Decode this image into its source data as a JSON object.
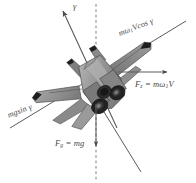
{
  "figure": {
    "background_color": "#ffffff",
    "line_color": "#58585a",
    "text_color": "#4a4a4a",
    "aircraft": {
      "name": "fighter-jet",
      "view": "rear-three-quarter",
      "body_fill": "#8d8d8d",
      "body_fill_dark": "#6b6b6b",
      "body_fill_light": "#b3b3b3",
      "wing_fill": "#a3a3a3",
      "edge_fill": "#1b1b1b",
      "nozzle_fill": "#2a2a2a"
    },
    "axes": [
      {
        "name": "vertical-dashed-reference",
        "style": "dashed",
        "orientation": "vertical",
        "arrow": "none"
      },
      {
        "name": "inclined-flight-path-axis",
        "style": "solid",
        "orientation": "inclined",
        "arrow": "start"
      },
      {
        "name": "lift-axis-diagonal",
        "style": "solid",
        "orientation": "diagonal",
        "arrow": "none"
      }
    ],
    "vectors": [
      {
        "name": "fz-vector",
        "direction": "right",
        "arrow": "end"
      },
      {
        "name": "fg-vector",
        "direction": "down",
        "arrow": "end"
      },
      {
        "name": "gamma-vector",
        "direction": "up-left",
        "arrow": "end"
      }
    ],
    "labels": {
      "gamma": "γ",
      "momega_vcos_gamma": {
        "prefix": "mω",
        "sub": "1",
        "suffix": "Vcos γ"
      },
      "fz": {
        "f": "F",
        "f_sub": "z",
        "eq": " = mω",
        "eq_sub": "1",
        "tail": "V"
      },
      "mg_sin_gamma": "mgsin γ",
      "fg": {
        "f": "F",
        "f_sub": "g",
        "eq": " = mg"
      }
    }
  }
}
